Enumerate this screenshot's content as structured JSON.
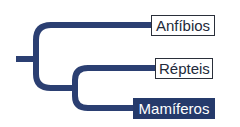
{
  "diagram": {
    "type": "cladogram",
    "branch_color": "#2b3f72",
    "highlight_color": "#253a6b",
    "taxa": [
      {
        "label": "Anfíbios",
        "highlighted": false
      },
      {
        "label": "Répteis",
        "highlighted": false
      },
      {
        "label": "Mamíferos",
        "highlighted": true
      }
    ]
  }
}
